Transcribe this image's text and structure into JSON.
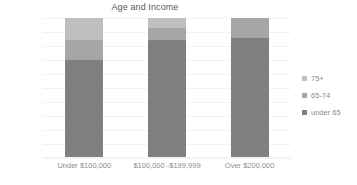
{
  "chart_data": {
    "type": "bar",
    "stacked": true,
    "stack_mode": "percent",
    "title": "Age and Income",
    "xlabel": "",
    "ylabel": "",
    "ylim": [
      0,
      100
    ],
    "ytick_labels": [
      "100%",
      "90%",
      "80%",
      "70%",
      "60%",
      "50%",
      "40%",
      "30%",
      "20%",
      "10%",
      "0%"
    ],
    "ytick_values": [
      100,
      90,
      80,
      70,
      60,
      50,
      40,
      30,
      20,
      10,
      0
    ],
    "grid": true,
    "legend_position": "right",
    "categories": [
      "Under $100,000",
      "$100,000 -$199,999",
      "Over $200,000"
    ],
    "series": [
      {
        "name": "under 65",
        "color": "#7f7f7f",
        "values": [
          70,
          84,
          86
        ]
      },
      {
        "name": "65-74",
        "color": "#a6a6a6",
        "values": [
          14,
          9,
          14
        ]
      },
      {
        "name": "75+",
        "color": "#bfbfbf",
        "values": [
          16,
          7,
          0
        ]
      }
    ],
    "legend_order": [
      "75+",
      "65-74",
      "under 65"
    ]
  },
  "chart": {
    "title": "Age and Income"
  },
  "y_axis": {
    "ticks": [
      {
        "label": "100%",
        "value": 100
      },
      {
        "label": "90%",
        "value": 90
      },
      {
        "label": "80%",
        "value": 80
      },
      {
        "label": "70%",
        "value": 70
      },
      {
        "label": "60%",
        "value": 60
      },
      {
        "label": "50%",
        "value": 50
      },
      {
        "label": "40%",
        "value": 40
      },
      {
        "label": "30%",
        "value": 30
      },
      {
        "label": "20%",
        "value": 20
      },
      {
        "label": "10%",
        "value": 10
      },
      {
        "label": "0%",
        "value": 0
      }
    ]
  },
  "x_axis": {
    "categories": [
      {
        "label": "Under $100,000"
      },
      {
        "label": "$100,000 -$199,999"
      },
      {
        "label": "Over $200,000"
      }
    ]
  },
  "legend": {
    "items": [
      {
        "label": "75+",
        "color": "#bfbfbf"
      },
      {
        "label": "65-74",
        "color": "#a6a6a6"
      },
      {
        "label": "under 65",
        "color": "#7f7f7f"
      }
    ]
  }
}
